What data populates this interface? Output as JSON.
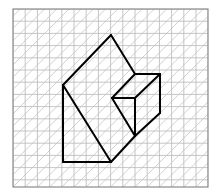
{
  "diagram": {
    "type": "isometric-grid-solid",
    "grid": {
      "left": 13,
      "top": 9,
      "right": 208,
      "bottom": 187,
      "cell": 12.2,
      "line_color": "#b8b8b8",
      "diagonal_color": "#c4c4c4",
      "border_color": "#8a8a8a"
    },
    "figure": {
      "stroke_color": "#000000",
      "vertices": {
        "A": [
          111,
          35
        ],
        "B": [
          63,
          85
        ],
        "C": [
          63,
          162
        ],
        "D": [
          111,
          162
        ],
        "E": [
          135,
          74
        ],
        "F": [
          160,
          74
        ],
        "G": [
          112,
          98
        ],
        "H": [
          135,
          98
        ],
        "I": [
          160,
          113
        ],
        "J": [
          135,
          136
        ]
      },
      "edges": [
        [
          "A",
          "B"
        ],
        [
          "A",
          "E"
        ],
        [
          "B",
          "C"
        ],
        [
          "C",
          "D"
        ],
        [
          "B",
          "D"
        ],
        [
          "D",
          "J"
        ],
        [
          "E",
          "F"
        ],
        [
          "E",
          "G"
        ],
        [
          "G",
          "H"
        ],
        [
          "H",
          "F"
        ],
        [
          "F",
          "I"
        ],
        [
          "I",
          "J"
        ],
        [
          "H",
          "J"
        ],
        [
          "G",
          "J"
        ]
      ]
    }
  }
}
